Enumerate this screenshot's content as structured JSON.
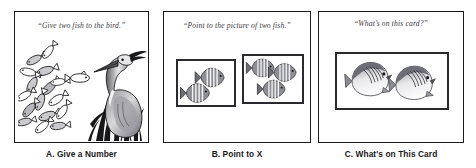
{
  "figure": {
    "panel_count": 3,
    "background_color": "#ffffff",
    "border_color": "#1a1a1a"
  },
  "panels": [
    {
      "id": "a",
      "letter": "A",
      "prompt": "“Give two fish to the bird.”",
      "caption": "A. Give a Number",
      "artwork": {
        "name": "heron-and-fish-school",
        "description": "A standing heron among reeds at right; a dense school of small outlined fish at left with one lone fish swimming toward the bird",
        "bird": "heron",
        "school_fish_count": 16,
        "lone_fish_count": 1,
        "style": "black-and-white line drawing"
      }
    },
    {
      "id": "b",
      "letter": "B",
      "prompt": "“Point to the picture of two fish.”",
      "caption": "B. Point to X",
      "artwork": {
        "name": "two-choice-fish-cards",
        "description": "Two bordered picture cards side by side; the left card shows two striped fish, the right card shows three striped fish",
        "cards": [
          {
            "name": "left-card",
            "fish_count": 2,
            "fish_type": "striped-gray-fish"
          },
          {
            "name": "right-card",
            "fish_count": 3,
            "fish_type": "striped-gray-fish"
          }
        ],
        "correct_card": "left-card"
      }
    },
    {
      "id": "c",
      "letter": "C",
      "prompt": "“What’s on this card?”",
      "caption": "C. What's on This Card",
      "artwork": {
        "name": "butterflyfish-card",
        "description": "A single bordered picture card showing two butterflyfish with dark crosshatched upper bodies and pale bellies",
        "cards": [
          {
            "name": "card",
            "fish_count": 2,
            "fish_type": "butterflyfish"
          }
        ]
      }
    }
  ]
}
